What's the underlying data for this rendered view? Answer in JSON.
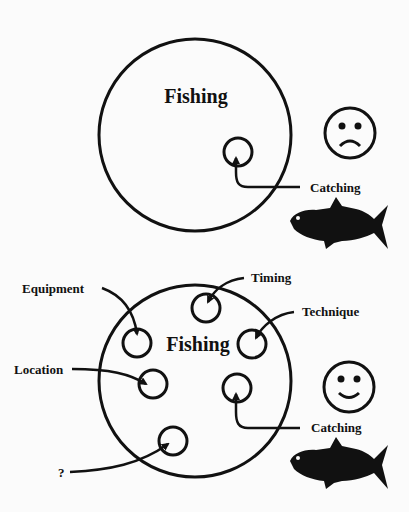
{
  "panels": [
    {
      "title": "Fishing",
      "mood": "sad",
      "labels": [
        {
          "id": "catching",
          "text": "Catching"
        }
      ]
    },
    {
      "title": "Fishing",
      "mood": "happy",
      "labels": [
        {
          "id": "equipment",
          "text": "Equipment"
        },
        {
          "id": "timing",
          "text": "Timing"
        },
        {
          "id": "technique",
          "text": "Technique"
        },
        {
          "id": "location",
          "text": "Location"
        },
        {
          "id": "catching",
          "text": "Catching"
        },
        {
          "id": "unknown",
          "text": "?"
        }
      ]
    }
  ],
  "icons": {
    "sad_face": "sad-face-icon",
    "happy_face": "happy-face-icon",
    "fish": "fish-icon"
  }
}
